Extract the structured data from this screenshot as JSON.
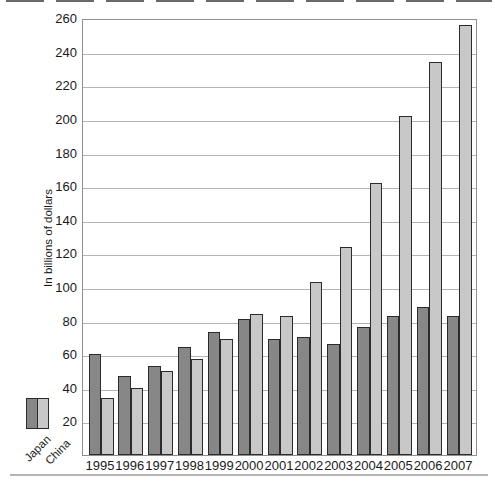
{
  "figure": {
    "y_axis_title": "In billions of dollars",
    "top_edge_artifact": "cropped-text-fragments",
    "bottom_rule": true
  },
  "colors": {
    "japan_bar": "#878787",
    "china_bar": "#c8c8c8",
    "bar_border": "#2b2b2b",
    "gridline": "#b3b3b3",
    "plot_border": "#8f8f8f",
    "text": "#1a1a1a",
    "background": "#ffffff"
  },
  "chart_data": {
    "type": "bar",
    "title": "",
    "xlabel": "",
    "ylabel": "In billions of dollars",
    "categories": [
      "1995",
      "1996",
      "1997",
      "1998",
      "1999",
      "2000",
      "2001",
      "2002",
      "2003",
      "2004",
      "2005",
      "2006",
      "2007"
    ],
    "series": [
      {
        "name": "Japan",
        "color": "#878787",
        "values": [
          60,
          47,
          53,
          64,
          73,
          81,
          69,
          70,
          66,
          76,
          83,
          88,
          83
        ]
      },
      {
        "name": "China",
        "color": "#c8c8c8",
        "values": [
          34,
          40,
          50,
          57,
          69,
          84,
          83,
          103,
          124,
          162,
          202,
          234,
          256
        ]
      }
    ],
    "ylim": [
      0,
      260
    ],
    "yticks": [
      20,
      40,
      60,
      80,
      100,
      120,
      140,
      160,
      180,
      200,
      220,
      240,
      260
    ],
    "grid": true,
    "legend_position": "bottom-left"
  }
}
